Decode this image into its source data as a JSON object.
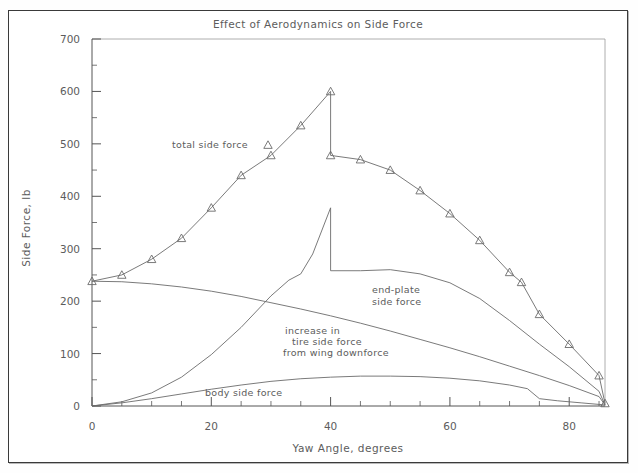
{
  "figure": {
    "title": "Effect of Aerodynamics on Side Force",
    "xlabel": "Yaw Angle, degrees",
    "ylabel": "Side Force, lb"
  },
  "annotations": {
    "total": "total side force",
    "endplate_line1": "end-plate",
    "endplate_line2": "side force",
    "increase_line1": "increase in",
    "increase_line2": "tire side force",
    "increase_line3": "from wing downforce",
    "body": "body side force"
  },
  "axes": {
    "xticks": [
      0,
      20,
      40,
      60,
      80
    ],
    "xticklabels": [
      "0",
      "20",
      "40",
      "60",
      "80"
    ],
    "yticks": [
      0,
      100,
      200,
      300,
      400,
      500,
      600,
      700
    ],
    "yticklabels": [
      "0",
      "100",
      "200",
      "300",
      "400",
      "500",
      "600",
      "700"
    ],
    "xlim": [
      0,
      86
    ],
    "ylim": [
      0,
      700
    ],
    "xminor_step": 5,
    "yminor_step": 50
  },
  "style": {
    "line_color": "#6b6b6b",
    "text_color": "#5c5c5c",
    "frame_color": "#3a3a3a",
    "background": "#ffffff"
  },
  "chart_data": {
    "type": "line",
    "title": "Effect of Aerodynamics on Side Force",
    "xlabel": "Yaw Angle, degrees",
    "ylabel": "Side Force, lb",
    "xlim": [
      0,
      86
    ],
    "ylim": [
      0,
      700
    ],
    "grid": false,
    "legend": "annotated inline",
    "series": [
      {
        "name": "total side force",
        "marker": "triangle",
        "note": "discontinuity at 40 degrees: drops from 600 to 478",
        "points": [
          [
            0,
            238
          ],
          [
            5,
            250
          ],
          [
            10,
            280
          ],
          [
            15,
            320
          ],
          [
            20,
            378
          ],
          [
            25,
            440
          ],
          [
            30,
            478
          ],
          [
            35,
            535
          ],
          [
            40,
            600
          ],
          [
            40,
            478
          ],
          [
            45,
            470
          ],
          [
            50,
            450
          ],
          [
            55,
            411
          ],
          [
            60,
            367
          ],
          [
            65,
            316
          ],
          [
            70,
            255
          ],
          [
            72,
            236
          ],
          [
            75,
            175
          ],
          [
            80,
            118
          ],
          [
            85,
            58
          ],
          [
            86,
            5
          ]
        ]
      },
      {
        "name": "end-plate side force",
        "marker": "none",
        "note": "discontinuity at 40 degrees: drops from 378 to 258",
        "points": [
          [
            0,
            0
          ],
          [
            5,
            8
          ],
          [
            10,
            25
          ],
          [
            15,
            55
          ],
          [
            20,
            98
          ],
          [
            25,
            150
          ],
          [
            30,
            210
          ],
          [
            33,
            240
          ],
          [
            35,
            252
          ],
          [
            37,
            290
          ],
          [
            40,
            378
          ],
          [
            40,
            258
          ],
          [
            45,
            258
          ],
          [
            50,
            260
          ],
          [
            55,
            252
          ],
          [
            60,
            235
          ],
          [
            65,
            205
          ],
          [
            70,
            163
          ],
          [
            75,
            118
          ],
          [
            80,
            75
          ],
          [
            85,
            28
          ],
          [
            86,
            2
          ]
        ]
      },
      {
        "name": "increase in tire side force from wing downforce",
        "marker": "none",
        "points": [
          [
            0,
            238
          ],
          [
            5,
            237
          ],
          [
            10,
            233
          ],
          [
            15,
            227
          ],
          [
            20,
            219
          ],
          [
            25,
            209
          ],
          [
            30,
            197
          ],
          [
            35,
            185
          ],
          [
            40,
            172
          ],
          [
            45,
            158
          ],
          [
            50,
            143
          ],
          [
            55,
            127
          ],
          [
            60,
            111
          ],
          [
            65,
            94
          ],
          [
            70,
            76
          ],
          [
            75,
            58
          ],
          [
            80,
            39
          ],
          [
            85,
            18
          ],
          [
            86,
            2
          ]
        ]
      },
      {
        "name": "body side force",
        "marker": "none",
        "note": "kink near 75 degrees",
        "points": [
          [
            0,
            0
          ],
          [
            5,
            6
          ],
          [
            10,
            14
          ],
          [
            15,
            23
          ],
          [
            20,
            32
          ],
          [
            25,
            40
          ],
          [
            30,
            47
          ],
          [
            35,
            52
          ],
          [
            40,
            55
          ],
          [
            45,
            57
          ],
          [
            50,
            57
          ],
          [
            55,
            56
          ],
          [
            60,
            53
          ],
          [
            65,
            48
          ],
          [
            70,
            40
          ],
          [
            73,
            33
          ],
          [
            75,
            14
          ],
          [
            78,
            10
          ],
          [
            82,
            6
          ],
          [
            86,
            2
          ]
        ]
      }
    ]
  }
}
